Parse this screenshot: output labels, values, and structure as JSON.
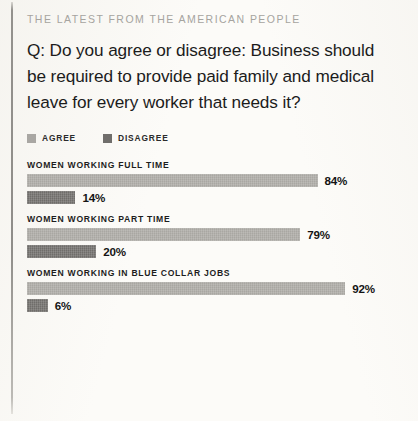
{
  "kicker": "THE LATEST FROM THE AMERICAN PEOPLE",
  "question": "Q: Do you agree or disagree: Business should be required to provide paid family and medical leave for every worker that needs it?",
  "legend": {
    "agree_label": "AGREE",
    "disagree_label": "DISAGREE",
    "agree_color": "#a9a7a2",
    "disagree_color": "#6f6d6a"
  },
  "chart_data": {
    "type": "bar",
    "title": "Q: Do you agree or disagree: Business should be required to provide paid family and medical leave for every worker that needs it?",
    "orientation": "horizontal",
    "xlabel": "",
    "ylabel": "",
    "xlim": [
      0,
      100
    ],
    "grid": false,
    "legend_position": "top-left",
    "categories": [
      "WOMEN WORKING FULL TIME",
      "WOMEN WORKING PART TIME",
      "WOMEN WORKING IN BLUE COLLAR JOBS"
    ],
    "series": [
      {
        "name": "AGREE",
        "color": "#a9a7a2",
        "values": [
          84,
          79,
          92
        ]
      },
      {
        "name": "DISAGREE",
        "color": "#6f6d6a",
        "values": [
          14,
          20,
          6
        ]
      }
    ],
    "groups": [
      {
        "label": "WOMEN WORKING FULL TIME",
        "agree_value": 84,
        "agree_text": "84%",
        "disagree_value": 14,
        "disagree_text": "14%"
      },
      {
        "label": "WOMEN WORKING PART TIME",
        "agree_value": 79,
        "agree_text": "79%",
        "disagree_value": 20,
        "disagree_text": "20%"
      },
      {
        "label": "WOMEN WORKING IN BLUE COLLAR JOBS",
        "agree_value": 92,
        "agree_text": "92%",
        "disagree_value": 6,
        "disagree_text": "6%"
      }
    ]
  }
}
